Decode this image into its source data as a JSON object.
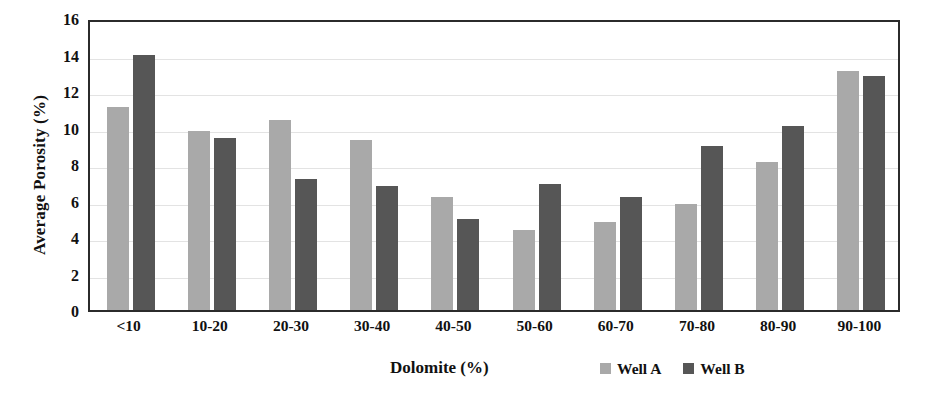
{
  "chart_data": {
    "type": "bar",
    "title": "",
    "xlabel": "Dolomite (%)",
    "ylabel": "Average Porosity (%)",
    "categories": [
      "<10",
      "10-20",
      "20-30",
      "30-40",
      "40-50",
      "50-60",
      "60-70",
      "70-80",
      "80-90",
      "90-100"
    ],
    "series": [
      {
        "name": "Well A",
        "color": "#a9a9a9",
        "values": [
          11.1,
          9.8,
          10.4,
          9.3,
          6.2,
          4.4,
          4.8,
          5.8,
          8.1,
          13.1
        ]
      },
      {
        "name": "Well B",
        "color": "#565656",
        "values": [
          14.0,
          9.4,
          7.2,
          6.8,
          5.0,
          6.9,
          6.2,
          9.0,
          10.1,
          12.8
        ]
      }
    ],
    "ylim": [
      0,
      16
    ],
    "ytick_step": 2,
    "yticks": [
      0,
      2,
      4,
      6,
      8,
      10,
      12,
      14,
      16
    ],
    "ytick_labels": [
      "0",
      "2",
      "4",
      "6",
      "8",
      "10",
      "12",
      "14",
      "16"
    ],
    "grid": true,
    "grid_axis": "y",
    "legend_position": "below-right",
    "frame_color": "#2b2b2b",
    "grid_color": "#e3e3e3"
  }
}
